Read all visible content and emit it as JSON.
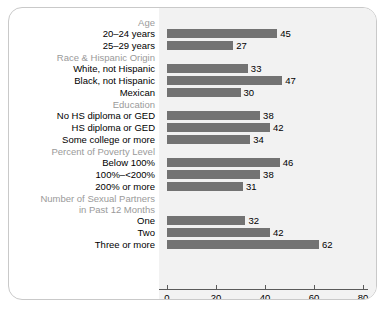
{
  "chart_data": {
    "type": "bar",
    "orientation": "horizontal",
    "title": "",
    "xlabel": "",
    "ylabel": "",
    "xlim": [
      0,
      80
    ],
    "xticks": [
      0,
      20,
      40,
      60,
      80
    ],
    "grid": false,
    "bar_color": "#737373",
    "plot_background": "#f2f2f2",
    "group_header_color": "#9a9a9a",
    "label_color": "#000000",
    "groups": [
      {
        "header": "Age",
        "categories": [
          "20–24 years",
          "25–29 years"
        ],
        "values": [
          45,
          27
        ]
      },
      {
        "header": "Race & Hispanic Origin",
        "categories": [
          "White, not Hispanic",
          "Black, not Hispanic",
          "Mexican"
        ],
        "values": [
          33,
          47,
          30
        ]
      },
      {
        "header": "Education",
        "categories": [
          "No HS diploma or GED",
          "HS diploma or GED",
          "Some college or more"
        ],
        "values": [
          38,
          42,
          34
        ]
      },
      {
        "header": "Percent of Poverty Level",
        "categories": [
          "Below 100%",
          "100%–<200%",
          "200% or more"
        ],
        "values": [
          46,
          38,
          31
        ]
      },
      {
        "header": "Number of Sexual Partners\nin Past 12 Months",
        "header_lines": [
          "Number of Sexual Partners",
          "in Past 12 Months"
        ],
        "categories": [
          "One",
          "Two",
          "Three or more"
        ],
        "values": [
          32,
          42,
          62
        ]
      }
    ]
  },
  "rows": [
    {
      "kind": "header",
      "label": "Age"
    },
    {
      "kind": "bar",
      "label": "20–24 years",
      "value": 45
    },
    {
      "kind": "bar",
      "label": "25–29 years",
      "value": 27
    },
    {
      "kind": "header",
      "label": "Race & Hispanic Origin"
    },
    {
      "kind": "bar",
      "label": "White, not Hispanic",
      "value": 33
    },
    {
      "kind": "bar",
      "label": "Black, not Hispanic",
      "value": 47
    },
    {
      "kind": "bar",
      "label": "Mexican",
      "value": 30
    },
    {
      "kind": "header",
      "label": "Education"
    },
    {
      "kind": "bar",
      "label": "No HS diploma or GED",
      "value": 38
    },
    {
      "kind": "bar",
      "label": "HS diploma or GED",
      "value": 42
    },
    {
      "kind": "bar",
      "label": "Some college or more",
      "value": 34
    },
    {
      "kind": "header",
      "label": "Percent of Poverty Level"
    },
    {
      "kind": "bar",
      "label": "Below 100%",
      "value": 46
    },
    {
      "kind": "bar",
      "label": "100%–<200%",
      "value": 38
    },
    {
      "kind": "bar",
      "label": "200% or more",
      "value": 31
    },
    {
      "kind": "header",
      "label": "Number of Sexual Partners"
    },
    {
      "kind": "header",
      "label": "in Past 12 Months"
    },
    {
      "kind": "bar",
      "label": "One",
      "value": 32
    },
    {
      "kind": "bar",
      "label": "Two",
      "value": 42
    },
    {
      "kind": "bar",
      "label": "Three or more",
      "value": 62
    }
  ],
  "axis": {
    "ticks": [
      "0",
      "20",
      "40",
      "60",
      "80"
    ]
  }
}
